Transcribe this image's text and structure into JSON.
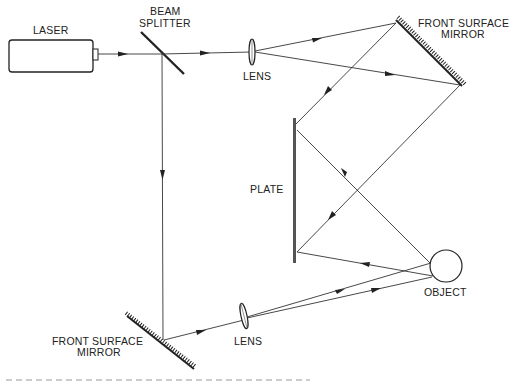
{
  "diagram": {
    "type": "optical-holography-setup",
    "components": {
      "laser": {
        "label": "LASER"
      },
      "beam_splitter": {
        "label_line1": "BEAM",
        "label_line2": "SPLITTER"
      },
      "lens_top": {
        "label": "LENS"
      },
      "mirror_top": {
        "label_line1": "FRONT SURFACE",
        "label_line2": "MIRROR"
      },
      "plate": {
        "label": "PLATE"
      },
      "object": {
        "label": "OBJECT"
      },
      "mirror_bottom": {
        "label_line1": "FRONT SURFACE",
        "label_line2": "MIRROR"
      },
      "lens_bottom": {
        "label": "LENS"
      }
    },
    "colors": {
      "line": "#333333",
      "background": "#ffffff"
    }
  }
}
